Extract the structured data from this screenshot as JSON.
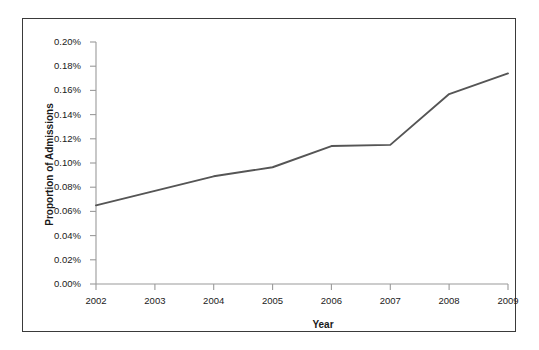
{
  "chart_data": {
    "type": "line",
    "title": "",
    "xlabel": "Year",
    "ylabel": "Proportion of Admissions",
    "categories": [
      "2002",
      "2003",
      "2004",
      "2005",
      "2006",
      "2007",
      "2008",
      "2009"
    ],
    "x": [
      2002,
      2003,
      2004,
      2005,
      2006,
      2007,
      2008,
      2009
    ],
    "values": [
      0.065,
      0.077,
      0.089,
      0.0965,
      0.114,
      0.115,
      0.157,
      0.174
    ],
    "value_labels": [
      "0.065%",
      "0.077%",
      "0.089%",
      "0.097%",
      "0.114%",
      "0.115%",
      "0.157%",
      "0.174%"
    ],
    "series": [
      {
        "name": "Proportion of Admissions",
        "values": [
          0.065,
          0.077,
          0.089,
          0.0965,
          0.114,
          0.115,
          0.157,
          0.174
        ],
        "color": "#555555"
      }
    ],
    "ylim": [
      0.0,
      0.2
    ],
    "yticks": [
      0.0,
      0.02,
      0.04,
      0.06,
      0.08,
      0.1,
      0.12,
      0.14,
      0.16,
      0.18,
      0.2
    ],
    "ytick_labels": [
      "0.00%",
      "0.02%",
      "0.04%",
      "0.06%",
      "0.08%",
      "0.10%",
      "0.12%",
      "0.14%",
      "0.16%",
      "0.18%",
      "0.20%"
    ],
    "xtick_labels": [
      "2002",
      "2003",
      "2004",
      "2005",
      "2006",
      "2007",
      "2008",
      "2009"
    ],
    "grid": false,
    "legend": false,
    "legend_position": "none",
    "units": "percent",
    "line_color": "#555555",
    "axis_color": "#9a9a9a",
    "text_color": "#1a1a1a",
    "frame_color": "#3a3a3a",
    "background_color": "#ffffff"
  }
}
